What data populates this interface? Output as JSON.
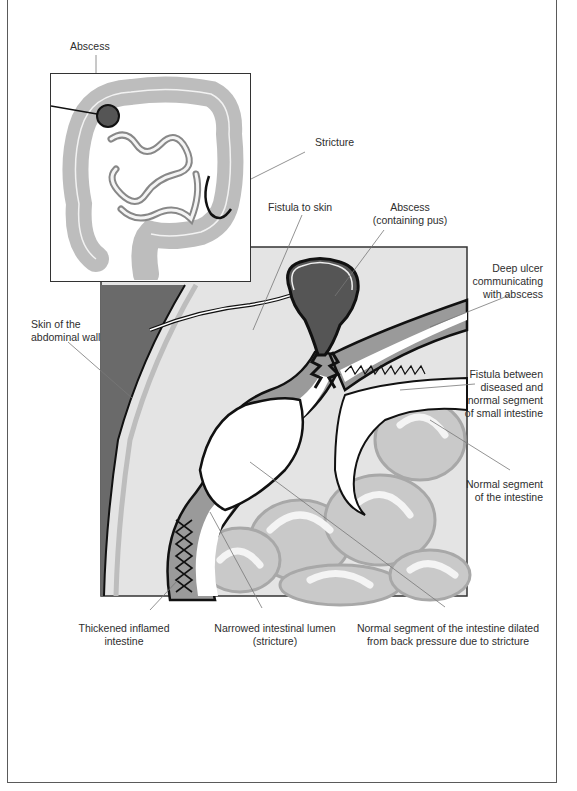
{
  "figure": {
    "inset_view": "Overview of large and small intestine",
    "main_view": "Cross-section of diseased intestine near abdominal wall"
  },
  "labels": {
    "abscess_inset": "Abscess",
    "stricture": "Stricture",
    "fistula_to_skin": "Fistula to skin",
    "abscess_main_line1": "Abscess",
    "abscess_main_line2": "(containing pus)",
    "deep_ulcer_line1": "Deep ulcer",
    "deep_ulcer_line2": "communicating",
    "deep_ulcer_line3": "with abscess",
    "skin_line1": "Skin of the",
    "skin_line2": "abdominal wall",
    "fistula_between_line1": "Fistula between",
    "fistula_between_line2": "diseased and",
    "fistula_between_line3": "normal segment",
    "fistula_between_line4": "of small intestine",
    "normal_segment_line1": "Normal segment",
    "normal_segment_line2": "of the intestine",
    "thickened_line1": "Thickened inflamed",
    "thickened_line2": "intestine",
    "narrowed_line1": "Narrowed intestinal lumen",
    "narrowed_line2": "(stricture)",
    "dilated_line1": "Normal segment of the intestine dilated",
    "dilated_line2": "from back pressure due to stricture"
  },
  "colors": {
    "abscess": "#555555",
    "abdominal_wall": "#6a6a6a",
    "tissue_light": "#e6e6e6",
    "bowel_wall": "#9a9a9a",
    "outline": "#111111",
    "leader_line": "#777777"
  }
}
